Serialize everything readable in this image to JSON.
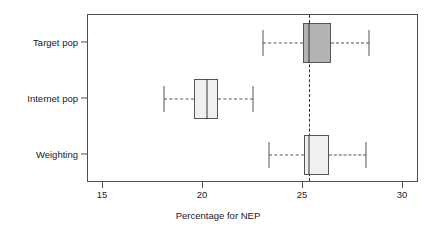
{
  "chart_data": {
    "type": "box",
    "orientation": "horizontal",
    "title": "",
    "xlabel": "Percentage for NEP",
    "ylabel": "",
    "xlim": [
      14.25,
      30.8
    ],
    "xticks": [
      15,
      20,
      25,
      30
    ],
    "xticklabels": [
      "15",
      "20",
      "25",
      "30"
    ],
    "categories": [
      "Target pop",
      "Internet pop",
      "Weighting"
    ],
    "grid": false,
    "legend": null,
    "reference_line": {
      "orientation": "vertical",
      "value": 25.3,
      "style": "dashed",
      "color": "#333333"
    },
    "boxes": [
      {
        "category": "Target pop",
        "whisker_low": 23.0,
        "q1": 25.0,
        "median": 25.3,
        "q3": 26.4,
        "whisker_high": 28.3,
        "fill": "#b3b3b3",
        "border": "#555555"
      },
      {
        "category": "Internet pop",
        "whisker_low": 18.05,
        "q1": 19.55,
        "median": 20.2,
        "q3": 20.75,
        "whisker_high": 22.5,
        "fill": "#f0f0f0",
        "border": "#555555"
      },
      {
        "category": "Weighting",
        "whisker_low": 23.3,
        "q1": 25.05,
        "median": 25.3,
        "q3": 26.3,
        "whisker_high": 28.15,
        "fill": "#f0f0f0",
        "border": "#555555"
      }
    ]
  },
  "axis": {
    "x_title": "Percentage for NEP",
    "tick_labels": [
      "15",
      "20",
      "25",
      "30"
    ],
    "category_labels": [
      "Target pop",
      "Internet pop",
      "Weighting"
    ]
  },
  "colors": {
    "panel_border": "#4d4d4d",
    "background": "#ffffff",
    "box_dark_fill": "#b3b3b3",
    "box_light_fill": "#f0f0f0",
    "stroke": "#555555"
  }
}
